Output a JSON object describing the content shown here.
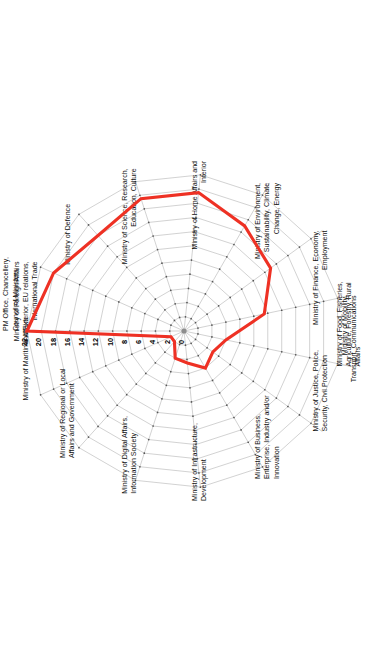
{
  "chart_data": {
    "type": "radar",
    "title": "",
    "subtitle": "",
    "xlabel": "",
    "ylabel": "",
    "rmin": 0,
    "rmax": 22,
    "rtick_step": 2,
    "rticks": [
      0,
      2,
      4,
      6,
      8,
      10,
      12,
      14,
      16,
      18,
      20,
      22
    ],
    "grid": true,
    "legend_position": "none",
    "rotation_deg": 90,
    "series_color": "#ee3124",
    "grid_color": "#9a9a9a",
    "categories": [
      "PM Office, Chancellery, Council of Ministers",
      "Ministry of Foreign Affairs and Exterior, EU relations, International Trade",
      "Ministry of Defence",
      "Ministry of Science, Research, Education, Culture",
      "Ministry of Home Affairs and Interior",
      "Ministry of Environment, Sustainability, Climate Change, Energy",
      "Ministry of Finance, Economy, Employment",
      "Ministry of Mobility, Transport, Communications",
      "Ministry of Food, Fisheries, Agriculture, Forestry, Rural Affairs",
      "Ministry of Justice, Police, Security, Civil Protection",
      "Ministry of Business, Enterprise, Industry and/or Innovation",
      "Ministry of Infrastructure, Development",
      "Ministry of Digital Affairs, Information Society",
      "Ministry of Regional or Local Affairs and Government",
      "Ministry of Maritime Affairs"
    ],
    "series": [
      {
        "name": "Ministries",
        "color": "#ee3124",
        "values": [
          22,
          20,
          18,
          19.5,
          19.5,
          17,
          15,
          11.5,
          6,
          5,
          6,
          4.5,
          4,
          2,
          2
        ]
      }
    ]
  }
}
